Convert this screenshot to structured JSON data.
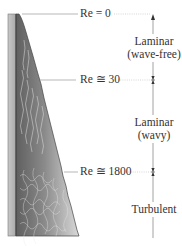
{
  "diagram": {
    "reynolds_markers": [
      {
        "label": "Re = 0",
        "y": 14
      },
      {
        "label": "Re ≅ 30",
        "y": 80
      },
      {
        "label": "Re ≅ 1800",
        "y": 172
      }
    ],
    "regimes": [
      {
        "line1": "Laminar",
        "line2": "(wave-free)"
      },
      {
        "line1": "Laminar",
        "line2": "(wavy)"
      },
      {
        "line1": "Turbulent",
        "line2": ""
      }
    ],
    "colors": {
      "plate": "#b5b5b5",
      "plate_edge": "#555555",
      "film_dark": "#6e6e6e",
      "film_light": "#d8d8d8",
      "line": "#9a9a9a",
      "text": "#333333"
    },
    "icons": {
      "flow_arrow": "arrow-up-icon",
      "boundary_marker": "double-arrow-tick-icon"
    }
  }
}
